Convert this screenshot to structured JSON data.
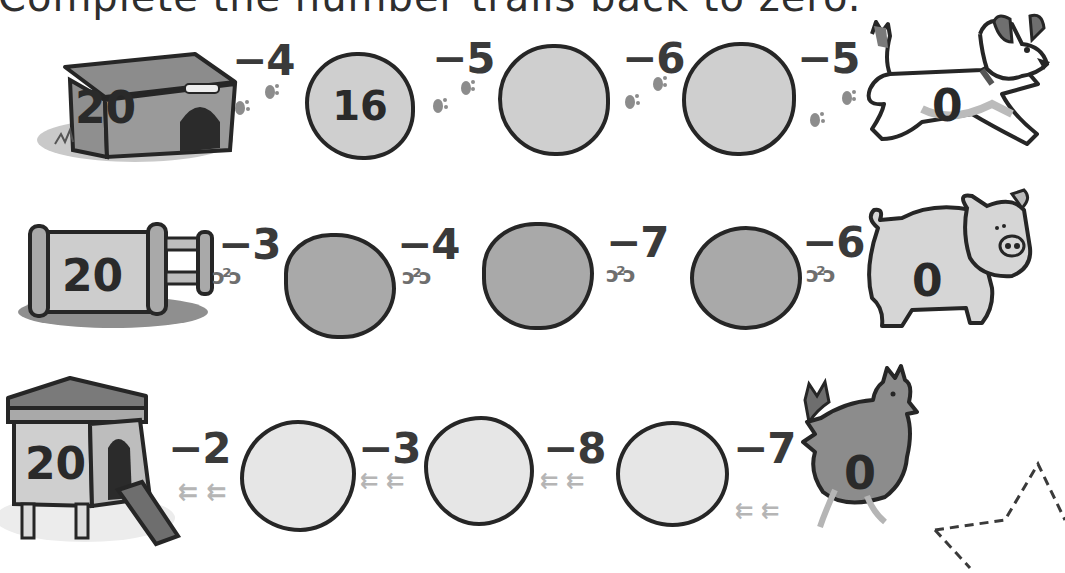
{
  "title": "Complete the number trails back to zero.",
  "rows": [
    {
      "animal": "dog",
      "start_place": "kennel",
      "start_value": "20",
      "end_value": "0",
      "steps": [
        "−4",
        "−5",
        "−6",
        "−5"
      ],
      "boxes": [
        "16",
        "",
        ""
      ],
      "trail_icon": "paw-print",
      "colors": {
        "box_fill": "#cfcfcf",
        "outline": "#262626"
      }
    },
    {
      "animal": "pig",
      "start_place": "pig-pen",
      "start_value": "20",
      "end_value": "0",
      "steps": [
        "−3",
        "−4",
        "−7",
        "−6"
      ],
      "boxes": [
        "",
        "",
        ""
      ],
      "trail_icon": "hoof-print",
      "colors": {
        "box_fill": "#a9a9a9",
        "outline": "#262626"
      }
    },
    {
      "animal": "hen",
      "start_place": "hen-house",
      "start_value": "20",
      "end_value": "0",
      "steps": [
        "−2",
        "−3",
        "−8",
        "−7"
      ],
      "boxes": [
        "",
        "",
        ""
      ],
      "trail_icon": "chicken-footprint",
      "colors": {
        "box_fill": "#e6e6e6",
        "outline": "#262626"
      }
    }
  ],
  "decoration": {
    "shape": "dashed-star"
  }
}
